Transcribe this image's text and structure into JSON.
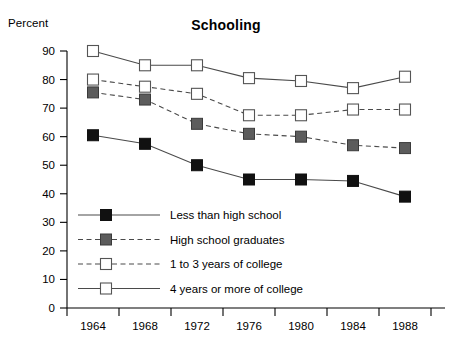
{
  "chart_data": {
    "type": "line",
    "title": "Schooling",
    "ylabel": "Percent",
    "xlabel": "",
    "x": [
      1964,
      1968,
      1972,
      1976,
      1980,
      1984,
      1988
    ],
    "xtick_labels": [
      "1964",
      "1968",
      "1972",
      "1976",
      "1980",
      "1984",
      "1988"
    ],
    "ytick_labels": [
      "0",
      "10",
      "20",
      "30",
      "40",
      "50",
      "60",
      "70",
      "80",
      "90"
    ],
    "ytick_values": [
      0,
      10,
      20,
      30,
      40,
      50,
      60,
      70,
      80,
      90
    ],
    "ylim": [
      0,
      90
    ],
    "grid": false,
    "legend_position": "inside-lower-left",
    "series": [
      {
        "name": "Less than high school",
        "marker": "filled-black-square",
        "line": "solid",
        "color": "#111111",
        "values": [
          60.5,
          57.5,
          50,
          45,
          45,
          44.5,
          39
        ]
      },
      {
        "name": "High school graduates",
        "marker": "filled-gray-square",
        "line": "dashed",
        "color": "#5c5c5c",
        "values": [
          75.5,
          73,
          64.5,
          61,
          60,
          57,
          56
        ]
      },
      {
        "name": "1 to 3 years of college",
        "marker": "open-square",
        "line": "dashed",
        "color": "#ffffff",
        "values": [
          80,
          77.5,
          75,
          67.5,
          67.5,
          69.5,
          69.5
        ]
      },
      {
        "name": "4 years or more of college",
        "marker": "open-square",
        "line": "solid",
        "color": "#ffffff",
        "values": [
          90,
          85,
          85,
          80.5,
          79.5,
          77,
          81
        ]
      }
    ]
  }
}
